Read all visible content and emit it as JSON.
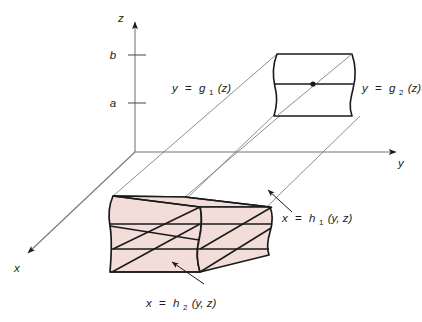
{
  "figure": {
    "type": "3d-solid-region-diagram",
    "background_color": "#ffffff",
    "stroke_color": "#1a1a1a",
    "solid_fill_color": "#f2ddd9",
    "guide_line_color": "#555555"
  },
  "axes": {
    "z": {
      "label": "z"
    },
    "y": {
      "label": "y"
    },
    "x": {
      "label": "x"
    },
    "ticks": [
      {
        "name": "b",
        "label": "b"
      },
      {
        "name": "a",
        "label": "a"
      }
    ]
  },
  "labels": {
    "g1": {
      "lhs": "y",
      "eq": "=",
      "fn": "g",
      "sub": "1",
      "arg": "(z)"
    },
    "g2": {
      "lhs": "y",
      "eq": "=",
      "fn": "g",
      "sub": "2",
      "arg": "(z)"
    },
    "h1": {
      "lhs": "x",
      "eq": "=",
      "fn": "h",
      "sub": "1",
      "arg": "(y, z)"
    },
    "h2": {
      "lhs": "x",
      "eq": "=",
      "fn": "h",
      "sub": "2",
      "arg": "(y, z)"
    }
  },
  "markers": {
    "projection_point": "filled-dot"
  }
}
